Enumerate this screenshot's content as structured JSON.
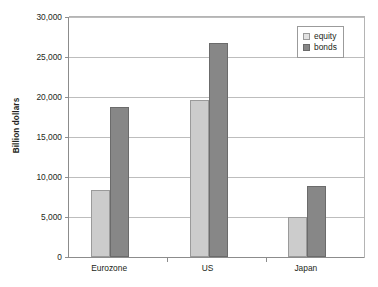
{
  "chart_data": {
    "type": "bar",
    "title": "",
    "xlabel": "",
    "ylabel": "Billion dollars",
    "categories": [
      "Eurozone",
      "US",
      "Japan"
    ],
    "series": [
      {
        "name": "equity",
        "color": "#cccccc",
        "values": [
          8400,
          19600,
          5000
        ]
      },
      {
        "name": "bonds",
        "color": "#878787",
        "values": [
          18800,
          26800,
          8900
        ]
      }
    ],
    "ylim": [
      0,
      30000
    ],
    "yticks": [
      0,
      5000,
      10000,
      15000,
      20000,
      25000,
      30000
    ],
    "ytick_labels": [
      "0",
      "5,000",
      "10,000",
      "15,000",
      "20,000",
      "25,000",
      "30,000"
    ],
    "grid": true,
    "legend_position": "top-right",
    "legend_entries": [
      "equity",
      "bonds"
    ]
  },
  "axis": {
    "y_title": "Billion dollars"
  },
  "legend": {
    "items": [
      {
        "label": "equity"
      },
      {
        "label": "bonds"
      }
    ]
  }
}
